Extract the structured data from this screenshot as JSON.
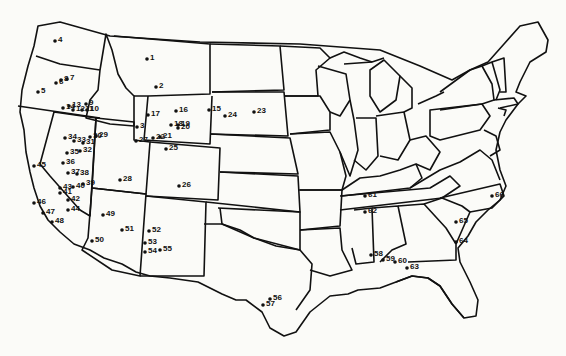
{
  "map": {
    "title": "",
    "region": "Contiguous United States",
    "points": [
      {
        "id": "1",
        "x": 147,
        "y": 59
      },
      {
        "id": "2",
        "x": 156,
        "y": 87
      },
      {
        "id": "3",
        "x": 137,
        "y": 127
      },
      {
        "id": "4",
        "x": 55,
        "y": 41
      },
      {
        "id": "5",
        "x": 38,
        "y": 92
      },
      {
        "id": "6",
        "x": 56,
        "y": 83
      },
      {
        "id": "7",
        "x": 67,
        "y": 79
      },
      {
        "id": "8",
        "x": 61,
        "y": 80
      },
      {
        "id": "9",
        "x": 86,
        "y": 104
      },
      {
        "id": "10",
        "x": 87,
        "y": 110
      },
      {
        "id": "11",
        "x": 82,
        "y": 110
      },
      {
        "id": "12",
        "x": 73,
        "y": 110
      },
      {
        "id": "13",
        "x": 69,
        "y": 106
      },
      {
        "id": "14",
        "x": 63,
        "y": 108
      },
      {
        "id": "15",
        "x": 209,
        "y": 110
      },
      {
        "id": "16",
        "x": 176,
        "y": 111
      },
      {
        "id": "17",
        "x": 148,
        "y": 115
      },
      {
        "id": "18",
        "x": 171,
        "y": 125
      },
      {
        "id": "19",
        "x": 178,
        "y": 125
      },
      {
        "id": "20",
        "x": 178,
        "y": 128
      },
      {
        "id": "21",
        "x": 160,
        "y": 137
      },
      {
        "id": "22",
        "x": 153,
        "y": 138
      },
      {
        "id": "23",
        "x": 254,
        "y": 112
      },
      {
        "id": "24",
        "x": 225,
        "y": 116
      },
      {
        "id": "25",
        "x": 166,
        "y": 149
      },
      {
        "id": "26",
        "x": 179,
        "y": 186
      },
      {
        "id": "27",
        "x": 136,
        "y": 141
      },
      {
        "id": "28",
        "x": 120,
        "y": 180
      },
      {
        "id": "29",
        "x": 96,
        "y": 136
      },
      {
        "id": "30",
        "x": 90,
        "y": 137
      },
      {
        "id": "31",
        "x": 83,
        "y": 143
      },
      {
        "id": "32",
        "x": 80,
        "y": 151
      },
      {
        "id": "33",
        "x": 74,
        "y": 141
      },
      {
        "id": "34",
        "x": 65,
        "y": 138
      },
      {
        "id": "35",
        "x": 67,
        "y": 153
      },
      {
        "id": "36",
        "x": 63,
        "y": 163
      },
      {
        "id": "37",
        "x": 68,
        "y": 173
      },
      {
        "id": "38",
        "x": 77,
        "y": 174
      },
      {
        "id": "39",
        "x": 83,
        "y": 184
      },
      {
        "id": "40",
        "x": 73,
        "y": 187
      },
      {
        "id": "41",
        "x": 60,
        "y": 193
      },
      {
        "id": "42",
        "x": 68,
        "y": 200
      },
      {
        "id": "43",
        "x": 60,
        "y": 188
      },
      {
        "id": "44",
        "x": 68,
        "y": 210
      },
      {
        "id": "45",
        "x": 34,
        "y": 166
      },
      {
        "id": "46",
        "x": 34,
        "y": 203
      },
      {
        "id": "47",
        "x": 43,
        "y": 213
      },
      {
        "id": "48",
        "x": 52,
        "y": 222
      },
      {
        "id": "49",
        "x": 103,
        "y": 215
      },
      {
        "id": "50",
        "x": 92,
        "y": 241
      },
      {
        "id": "51",
        "x": 122,
        "y": 230
      },
      {
        "id": "52",
        "x": 149,
        "y": 231
      },
      {
        "id": "53",
        "x": 145,
        "y": 243
      },
      {
        "id": "54",
        "x": 145,
        "y": 252
      },
      {
        "id": "55",
        "x": 160,
        "y": 250
      },
      {
        "id": "56",
        "x": 270,
        "y": 299
      },
      {
        "id": "57",
        "x": 263,
        "y": 305
      },
      {
        "id": "58",
        "x": 371,
        "y": 255
      },
      {
        "id": "59",
        "x": 383,
        "y": 260
      },
      {
        "id": "60",
        "x": 395,
        "y": 262
      },
      {
        "id": "61",
        "x": 365,
        "y": 196
      },
      {
        "id": "62",
        "x": 365,
        "y": 212
      },
      {
        "id": "63",
        "x": 407,
        "y": 268
      },
      {
        "id": "64",
        "x": 456,
        "y": 242
      },
      {
        "id": "65",
        "x": 456,
        "y": 222
      },
      {
        "id": "66",
        "x": 492,
        "y": 196
      }
    ]
  }
}
